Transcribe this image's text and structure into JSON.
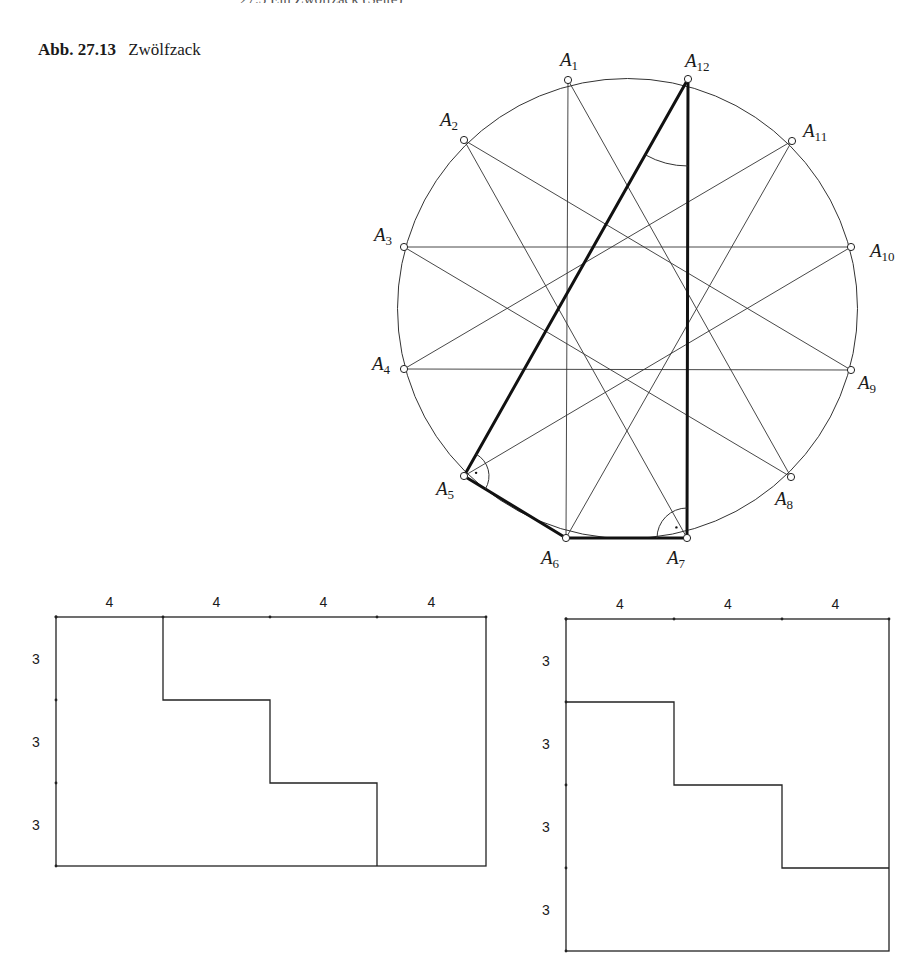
{
  "page": {
    "running_header": "27.3  Ein Zwölfzack (Seite)",
    "caption": {
      "number": "Abb. 27.13",
      "title": "Zwölfzack"
    }
  },
  "circle_figure": {
    "center": [
      627.5,
      308.5
    ],
    "radius": 230,
    "points": [
      {
        "name": "A",
        "sub": "1",
        "x": 568,
        "y": 80,
        "lx": 560,
        "ly": 66,
        "anchor": "start"
      },
      {
        "name": "A",
        "sub": "2",
        "x": 464,
        "y": 140,
        "lx": 440,
        "ly": 126,
        "anchor": "start"
      },
      {
        "name": "A",
        "sub": "3",
        "x": 404,
        "y": 247,
        "lx": 374,
        "ly": 241,
        "anchor": "start"
      },
      {
        "name": "A",
        "sub": "4",
        "x": 404,
        "y": 369,
        "lx": 372,
        "ly": 370,
        "anchor": "start"
      },
      {
        "name": "A",
        "sub": "5",
        "x": 464,
        "y": 476,
        "lx": 436,
        "ly": 495,
        "anchor": "start"
      },
      {
        "name": "A",
        "sub": "6",
        "x": 566,
        "y": 538,
        "lx": 541,
        "ly": 564,
        "anchor": "start"
      },
      {
        "name": "A",
        "sub": "7",
        "x": 687,
        "y": 538,
        "lx": 667,
        "ly": 564,
        "anchor": "start"
      },
      {
        "name": "A",
        "sub": "8",
        "x": 791,
        "y": 477,
        "lx": 775,
        "ly": 505,
        "anchor": "start"
      },
      {
        "name": "A",
        "sub": "9",
        "x": 851,
        "y": 370,
        "lx": 858,
        "ly": 389,
        "anchor": "start"
      },
      {
        "name": "A",
        "sub": "10",
        "x": 851,
        "y": 247,
        "lx": 870,
        "ly": 257,
        "anchor": "start"
      },
      {
        "name": "A",
        "sub": "11",
        "x": 792,
        "y": 141,
        "lx": 803,
        "ly": 137,
        "anchor": "start"
      },
      {
        "name": "A",
        "sub": "12",
        "x": 688,
        "y": 79,
        "lx": 685,
        "ly": 67,
        "anchor": "start"
      }
    ],
    "star_step": 5,
    "thick_edges": [
      [
        12,
        5
      ],
      [
        5,
        6
      ],
      [
        6,
        7
      ],
      [
        7,
        12
      ]
    ],
    "right_angle_marks": [
      "A5",
      "A7"
    ],
    "angle_arc_at": "A12"
  },
  "grid_left": {
    "x": [
      56,
      163,
      270,
      377,
      486
    ],
    "y": [
      617,
      700,
      783,
      866
    ],
    "col_labels": [
      "4",
      "4",
      "4",
      "4"
    ],
    "row_labels": [
      "3",
      "3",
      "3"
    ],
    "staircase": [
      [
        163,
        617
      ],
      [
        163,
        700
      ],
      [
        270,
        700
      ],
      [
        270,
        783
      ],
      [
        377,
        783
      ],
      [
        377,
        866
      ]
    ]
  },
  "grid_right": {
    "x": [
      566,
      674,
      782,
      889
    ],
    "y": [
      619,
      702,
      785,
      868,
      951
    ],
    "col_labels": [
      "4",
      "4",
      "4"
    ],
    "row_labels": [
      "3",
      "3",
      "3",
      "3"
    ],
    "staircase": [
      [
        566,
        702
      ],
      [
        674,
        702
      ],
      [
        674,
        785
      ],
      [
        782,
        785
      ],
      [
        782,
        868
      ],
      [
        889,
        868
      ]
    ]
  }
}
